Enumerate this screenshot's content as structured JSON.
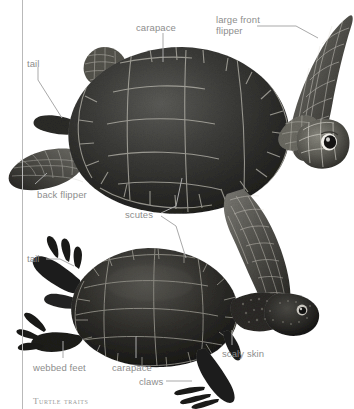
{
  "figure": {
    "caption": "Turtle traits",
    "background_color": "#ffffff",
    "label_color": "#8d8d8d",
    "leader_color": "#aaaaaa",
    "rule_color": "#b9b9b9"
  },
  "labels": {
    "carapace_top": "carapace",
    "large_front_flipper": "large front\nflipper",
    "tail_top": "tail",
    "back_flipper": "back flipper",
    "scutes": "scutes",
    "tail_bottom": "tail",
    "webbed_feet": "webbed feet",
    "carapace_bottom": "carapace",
    "claws": "claws",
    "scaly_skin": "scaly skin"
  },
  "subjects": [
    {
      "name": "sea-turtle",
      "common_name": "sea turtle",
      "parts": [
        "carapace",
        "large front flipper",
        "tail",
        "back flipper",
        "scutes"
      ]
    },
    {
      "name": "pond-turtle",
      "common_name": "pond turtle",
      "parts": [
        "carapace",
        "tail",
        "webbed feet",
        "claws",
        "scaly skin",
        "scutes"
      ]
    }
  ]
}
